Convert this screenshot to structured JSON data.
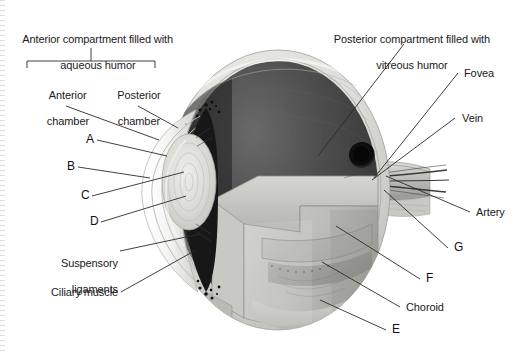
{
  "figure": {
    "background_color": "#ffffff",
    "line_color": "#2b2b2b"
  },
  "callouts": {
    "anterior_compartment": {
      "line1": "Anterior compartment filled with",
      "line2": "aqueous humor"
    },
    "anterior_chamber": {
      "line1": "Anterior",
      "line2": "chamber"
    },
    "posterior_chamber": {
      "line1": "Posterior",
      "line2": "chamber"
    },
    "posterior_compartment": {
      "line1": "Posterior compartment filled with",
      "line2": "vitreous humor"
    },
    "suspensory_ligaments": {
      "line1": "Suspensory",
      "line2": "ligaments"
    },
    "ciliary_muscle": "Ciliary muscle",
    "fovea": "Fovea",
    "vein": "Vein",
    "artery": "Artery",
    "choroid": "Choroid"
  },
  "letters": {
    "a": "A",
    "b": "B",
    "c": "C",
    "d": "D",
    "e": "E",
    "f": "F",
    "g": "G"
  },
  "colors": {
    "sclera_outer": "#e8e8e6",
    "sclera_rim": "#c9c9c5",
    "vitreous_dark": "#4a4a4a",
    "vitreous_darker": "#3a3a3a",
    "retina_wedge": "#bdbdb8",
    "choroid_band": "#a6a6a1",
    "lens": "#d9d9d4",
    "iris_dark": "#131313",
    "optic_disc": "#0d0d0d",
    "cornea": "#ededeb",
    "nerve": "#c2c2bd"
  }
}
